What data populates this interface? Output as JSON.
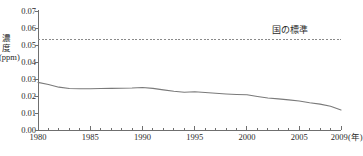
{
  "chart_data": {
    "type": "line",
    "title": "",
    "xlabel": "年",
    "ylabel": "濃度 (ppm)",
    "xlim": [
      1980,
      2009
    ],
    "ylim": [
      0.0,
      0.07
    ],
    "ytick_labels": [
      "0.07",
      "0.06",
      "0.05",
      "0.04",
      "0.03",
      "0.02",
      "0.01",
      "0.00"
    ],
    "ytick_values": [
      0.07,
      0.06,
      0.05,
      0.04,
      0.03,
      0.02,
      0.01,
      0.0
    ],
    "xtick_labels": [
      "1980",
      "1985",
      "1990",
      "1995",
      "2000",
      "2005",
      "2009"
    ],
    "xtick_values": [
      1980,
      1985,
      1990,
      1995,
      2000,
      2005,
      2009
    ],
    "x_unit_label": "(年)",
    "grid": false,
    "legend_position": "none",
    "annotations": [
      {
        "text": "国の標準",
        "value": 0.053,
        "style": "dashed-reference-line"
      }
    ],
    "reference_line": {
      "label": "国の標準",
      "value": 0.053,
      "dash": true
    },
    "series": [
      {
        "name": "濃度",
        "x": [
          1980,
          1981,
          1982,
          1983,
          1984,
          1985,
          1986,
          1987,
          1988,
          1989,
          1990,
          1991,
          1992,
          1993,
          1994,
          1995,
          1996,
          1997,
          1998,
          1999,
          2000,
          2001,
          2002,
          2003,
          2004,
          2005,
          2006,
          2007,
          2008,
          2009
        ],
        "values": [
          0.028,
          0.0268,
          0.0252,
          0.0244,
          0.0243,
          0.0243,
          0.0244,
          0.0245,
          0.0246,
          0.0247,
          0.025,
          0.0245,
          0.0236,
          0.0228,
          0.0222,
          0.0225,
          0.0221,
          0.0216,
          0.0212,
          0.0209,
          0.0207,
          0.0197,
          0.0188,
          0.0183,
          0.0177,
          0.0171,
          0.016,
          0.0152,
          0.014,
          0.0118
        ]
      }
    ]
  },
  "axis": {
    "y_label_text": "濃度 (ppm)"
  }
}
